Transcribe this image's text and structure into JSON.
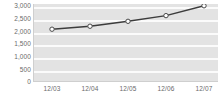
{
  "chart_data": {
    "type": "line",
    "title": "",
    "xlabel": "",
    "ylabel": "",
    "categories": [
      "12/03",
      "12/04",
      "12/05",
      "12/06",
      "12/07"
    ],
    "values": [
      2100,
      2220,
      2420,
      2650,
      3050
    ],
    "series": [
      {
        "name": "",
        "values": [
          2100,
          2220,
          2420,
          2650,
          3050
        ]
      }
    ],
    "ylim": [
      0,
      3000
    ],
    "yticks": [
      0,
      500,
      1000,
      1500,
      2000,
      2500,
      3000
    ],
    "ytick_labels": [
      "0",
      "500",
      "1,000",
      "1,500",
      "2,000",
      "2,500",
      "3,000"
    ],
    "grid": true,
    "legend": "none",
    "colors": {
      "line": "#3c3c3c",
      "marker_fill": "#ffffff",
      "marker_edge": "#4a4a4a",
      "plot_background": "#e3e3e3",
      "gridline": "#fbfbfb",
      "axis": "#cfcfcf",
      "tick_label": "#6a6a6a"
    }
  }
}
